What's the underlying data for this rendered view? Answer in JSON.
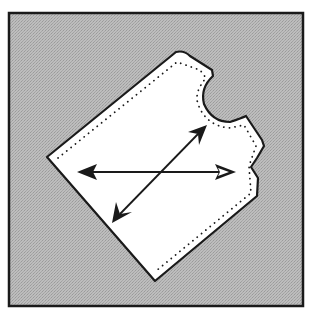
{
  "figure": {
    "colors": {
      "background": "#ffffff",
      "fabric": "#b9b9b9",
      "fabric_dark": "#9a9a9a",
      "piece": "#ffffff",
      "outline": "#1a1a1a"
    },
    "frame": {
      "x": 9,
      "y": 13,
      "width": 294,
      "height": 293
    },
    "pattern_piece": {
      "points": "47,157 176,52 184,55 200,60 213,72 205,96 212,112 228,120 245,116 252,124 263,146 258,160 252,168 258,178 256,196 155,281"
    },
    "seam_line": {
      "points": "57,158 177,62 200,69 206,77 199,96 207,115 228,128 244,125 258,147 249,168 250,193 156,270"
    },
    "arrows": [
      {
        "name": "horizontal-grain-arrow",
        "x1": 78,
        "y1": 172,
        "x2": 235,
        "y2": 172
      },
      {
        "name": "diagonal-bias-arrow",
        "x1": 113,
        "y1": 222,
        "x2": 206,
        "y2": 126
      }
    ]
  }
}
